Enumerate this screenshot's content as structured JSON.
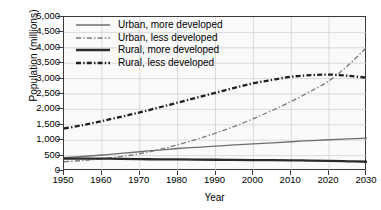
{
  "chart_data": {
    "type": "line",
    "title": "",
    "xlabel": "Year",
    "ylabel": "Population (millions)",
    "xlim": [
      1950,
      2030
    ],
    "ylim": [
      0,
      5000
    ],
    "grid": true,
    "legend_position": "top-left inside plot",
    "xticks": [
      "1950",
      "1960",
      "1970",
      "1980",
      "1990",
      "2000",
      "2010",
      "2020",
      "2030"
    ],
    "yticks": [
      "0",
      "500",
      "1,000",
      "1,500",
      "2,000",
      "2,500",
      "3,000",
      "3,500",
      "4,000",
      "4,500",
      "5,000"
    ],
    "x": [
      1950,
      1955,
      1960,
      1965,
      1970,
      1975,
      1980,
      1985,
      1990,
      1995,
      2000,
      2005,
      2010,
      2015,
      2020,
      2025,
      2030
    ],
    "series": [
      {
        "name": "Urban, more developed",
        "style": "solid-thin",
        "color": "#6f6f6f",
        "values": [
          430,
          470,
          520,
          570,
          625,
          680,
          730,
          770,
          810,
          845,
          880,
          915,
          950,
          985,
          1015,
          1040,
          1065
        ]
      },
      {
        "name": "Urban, less developed",
        "style": "dashdot-thin",
        "color": "#7a7a7a",
        "values": [
          300,
          340,
          395,
          470,
          560,
          690,
          850,
          1030,
          1230,
          1450,
          1700,
          1970,
          2260,
          2580,
          2930,
          3430,
          4030
        ]
      },
      {
        "name": "Rural, more developed",
        "style": "solid-thick",
        "color": "#2b2b2b",
        "values": [
          400,
          405,
          400,
          395,
          385,
          380,
          375,
          370,
          365,
          360,
          355,
          350,
          345,
          340,
          330,
          315,
          300
        ]
      },
      {
        "name": "Rural, less developed",
        "style": "dashdot-thick",
        "color": "#1f1f1f",
        "values": [
          1380,
          1490,
          1620,
          1760,
          1900,
          2060,
          2220,
          2380,
          2540,
          2700,
          2850,
          2960,
          3060,
          3110,
          3130,
          3090,
          3030
        ]
      }
    ]
  },
  "legend": {
    "items": [
      {
        "label": "Urban, more developed"
      },
      {
        "label": "Urban, less developed"
      },
      {
        "label": "Rural, more developed"
      },
      {
        "label": "Rural, less developed"
      }
    ]
  }
}
